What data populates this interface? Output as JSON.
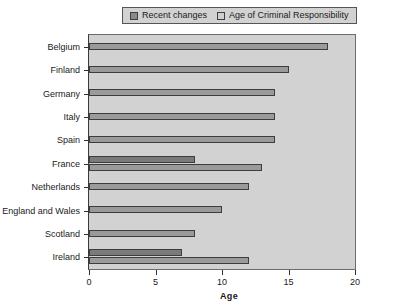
{
  "chart_data": {
    "type": "bar",
    "orientation": "horizontal",
    "title": "",
    "xlabel": "Age",
    "ylabel": "",
    "xlim": [
      0,
      20
    ],
    "xticks": [
      0,
      5,
      10,
      15,
      20
    ],
    "grid": false,
    "legend_position": "top",
    "categories": [
      "Belgium",
      "Finland",
      "Germany",
      "Italy",
      "Spain",
      "France",
      "Netherlands",
      "England and Wales",
      "Scotland",
      "Ireland"
    ],
    "series": [
      {
        "name": "Recent changes",
        "color": "#7a7a7a",
        "values": [
          null,
          null,
          null,
          null,
          null,
          8,
          null,
          null,
          null,
          7
        ]
      },
      {
        "name": "Age of Criminal Responsibility",
        "color": "#9a9a9a",
        "values": [
          18,
          15,
          14,
          14,
          14,
          13,
          12,
          10,
          8,
          12
        ]
      }
    ]
  },
  "legend": {
    "entries": [
      {
        "label": "Recent changes",
        "swatch": "recent-changes-swatch"
      },
      {
        "label": "Age of Criminal Responsibility",
        "swatch": "age-of-criminal-responsibility-swatch"
      }
    ]
  },
  "axes": {
    "x": {
      "title": "Age",
      "tick_labels": [
        "0",
        "5",
        "10",
        "15",
        "20"
      ]
    },
    "y": {
      "tick_labels": [
        "Belgium",
        "Finland",
        "Germany",
        "Italy",
        "Spain",
        "France",
        "Netherlands",
        "England and Wales",
        "Scotland",
        "Ireland"
      ]
    }
  },
  "colors": {
    "plot_background": "#d2d2d2",
    "recent_changes": "#7a7a7a",
    "age_of_criminal_responsibility": "#9a9a9a",
    "axis": "#303030",
    "text": "#1a1a1a"
  }
}
